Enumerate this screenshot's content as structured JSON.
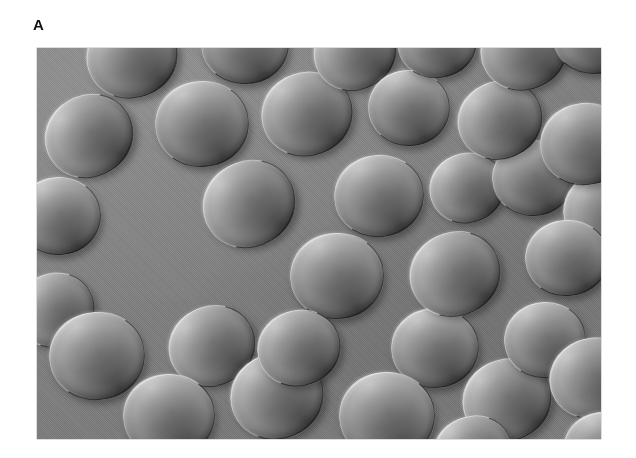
{
  "figure": {
    "panel_label": "A",
    "caption": "",
    "background_color": "#ffffff"
  },
  "micrograph": {
    "name": "erythrocyte-dic-micrograph",
    "modality": "differential-interference-contrast",
    "specimen": "red blood cells",
    "field_color": "#8b8b8b",
    "frame": {
      "x": 37,
      "y": 48,
      "width": 564,
      "height": 391
    },
    "cell_count_visible": 34,
    "cells": [
      {
        "cx": 95,
        "cy": 8,
        "rx": 46,
        "ry": 42,
        "rot": -8
      },
      {
        "cx": 208,
        "cy": -4,
        "rx": 44,
        "ry": 40,
        "rot": 12
      },
      {
        "cx": 318,
        "cy": 4,
        "rx": 42,
        "ry": 38,
        "rot": -14
      },
      {
        "cx": 400,
        "cy": -6,
        "rx": 40,
        "ry": 36,
        "rot": 6
      },
      {
        "cx": 487,
        "cy": 2,
        "rx": 44,
        "ry": 40,
        "rot": -10
      },
      {
        "cx": 556,
        "cy": -10,
        "rx": 40,
        "ry": 36,
        "rot": 16
      },
      {
        "cx": 52,
        "cy": 88,
        "rx": 45,
        "ry": 41,
        "rot": -18
      },
      {
        "cx": 165,
        "cy": 76,
        "rx": 47,
        "ry": 43,
        "rot": 8
      },
      {
        "cx": 270,
        "cy": 66,
        "rx": 46,
        "ry": 42,
        "rot": -6
      },
      {
        "cx": 372,
        "cy": 60,
        "rx": 41,
        "ry": 38,
        "rot": 14
      },
      {
        "cx": 463,
        "cy": 72,
        "rx": 43,
        "ry": 39,
        "rot": -12
      },
      {
        "cx": 548,
        "cy": 96,
        "rx": 45,
        "ry": 41,
        "rot": 4
      },
      {
        "cx": 22,
        "cy": 168,
        "rx": 42,
        "ry": 39,
        "rot": 10
      },
      {
        "cx": 212,
        "cy": 156,
        "rx": 47,
        "ry": 43,
        "rot": -16
      },
      {
        "cx": 342,
        "cy": 148,
        "rx": 45,
        "ry": 41,
        "rot": 6
      },
      {
        "cx": 430,
        "cy": 140,
        "rx": 38,
        "ry": 35,
        "rot": -8
      },
      {
        "cx": 496,
        "cy": 130,
        "rx": 41,
        "ry": 38,
        "rot": 12
      },
      {
        "cx": 570,
        "cy": 162,
        "rx": 44,
        "ry": 40,
        "rot": -6
      },
      {
        "cx": 300,
        "cy": 228,
        "rx": 47,
        "ry": 43,
        "rot": 10
      },
      {
        "cx": 418,
        "cy": 226,
        "rx": 46,
        "ry": 42,
        "rot": -12
      },
      {
        "cx": 530,
        "cy": 210,
        "rx": 42,
        "ry": 38,
        "rot": 8
      },
      {
        "cx": 18,
        "cy": 262,
        "rx": 40,
        "ry": 37,
        "rot": -10
      },
      {
        "cx": 60,
        "cy": 308,
        "rx": 48,
        "ry": 44,
        "rot": 6
      },
      {
        "cx": 175,
        "cy": 298,
        "rx": 44,
        "ry": 40,
        "rot": -14
      },
      {
        "cx": 132,
        "cy": 368,
        "rx": 46,
        "ry": 42,
        "rot": 10
      },
      {
        "cx": 240,
        "cy": 348,
        "rx": 47,
        "ry": 43,
        "rot": -8
      },
      {
        "cx": 350,
        "cy": 368,
        "rx": 48,
        "ry": 44,
        "rot": 12
      },
      {
        "cx": 262,
        "cy": 300,
        "rx": 42,
        "ry": 38,
        "rot": -6
      },
      {
        "cx": 398,
        "cy": 300,
        "rx": 44,
        "ry": 40,
        "rot": 8
      },
      {
        "cx": 470,
        "cy": 352,
        "rx": 45,
        "ry": 41,
        "rot": -12
      },
      {
        "cx": 508,
        "cy": 292,
        "rx": 41,
        "ry": 38,
        "rot": 6
      },
      {
        "cx": 556,
        "cy": 330,
        "rx": 44,
        "ry": 40,
        "rot": -10
      },
      {
        "cx": 568,
        "cy": 402,
        "rx": 42,
        "ry": 38,
        "rot": 14
      },
      {
        "cx": 436,
        "cy": 404,
        "rx": 40,
        "ry": 36,
        "rot": -8
      }
    ]
  }
}
